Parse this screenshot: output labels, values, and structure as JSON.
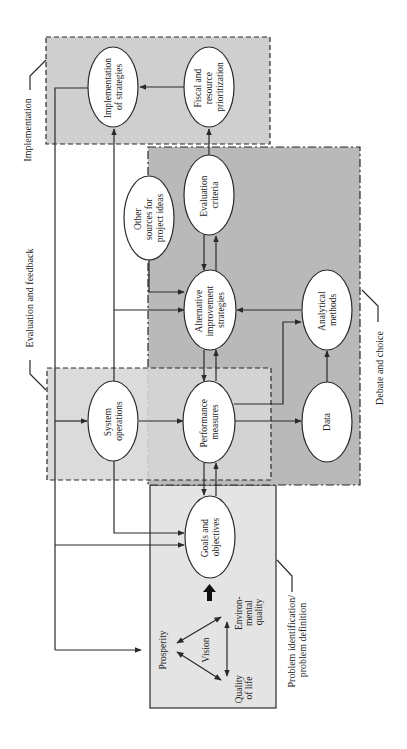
{
  "diagram": {
    "colors": {
      "implementation_fill": "#cfcfcf",
      "evaluation_fill": "#d6d6d6",
      "debate_fill": "#b9b9b9",
      "problem_fill": "#e4e4e4",
      "line": "#2a2a2a",
      "node_fill": "#ffffff"
    },
    "regions": {
      "implementation": {
        "label": "Implementation"
      },
      "evaluation": {
        "label": "Evaluation and feedback"
      },
      "debate": {
        "label": "Debate and choice"
      },
      "problem": {
        "label_line1": "Problem identification/",
        "label_line2": "problem definition"
      }
    },
    "nodes": {
      "implementation_of_strategies": {
        "line1": "Implementation",
        "line2": "of strategies"
      },
      "fiscal_prioritization": {
        "line1": "Fiscal and",
        "line2": "resource",
        "line3": "prioritization"
      },
      "other_sources": {
        "line1": "Other",
        "line2": "sources for",
        "line3": "project ideas"
      },
      "evaluation_criteria": {
        "line1": "Evaluation",
        "line2": "criteria"
      },
      "alternative_strategies": {
        "line1": "Alternative",
        "line2": "improvement",
        "line3": "strategies"
      },
      "analytical_methods": {
        "line1": "Analytical",
        "line2": "methods"
      },
      "system_operations": {
        "line1": "System",
        "line2": "operations"
      },
      "performance_measures": {
        "line1": "Performance",
        "line2": "measures"
      },
      "data": {
        "line1": "Data"
      },
      "goals_objectives": {
        "line1": "Goals and",
        "line2": "objectives"
      }
    },
    "vision_triangle": {
      "center": "Vision",
      "prosperity": "Prosperity",
      "environmental_line1": "Environ-",
      "environmental_line2": "mental",
      "environmental_line3": "quality",
      "quality_line1": "Quality",
      "quality_line2": "of life"
    }
  }
}
